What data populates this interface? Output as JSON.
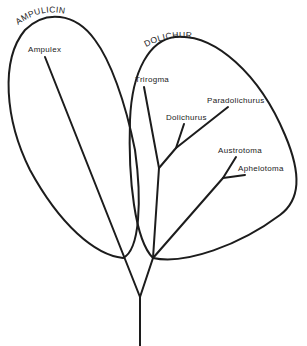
{
  "diagram": {
    "type": "phylogenetic-tree",
    "groups": [
      {
        "name": "AMPULICINI",
        "members": [
          "Ampulex"
        ]
      },
      {
        "name": "DOLICHURINI",
        "members": [
          "Trirogma",
          "Dolichurus",
          "Paradolichurus",
          "Austrotoma",
          "Aphelotoma"
        ]
      }
    ],
    "taxa": {
      "ampulex": "Ampulex",
      "trirogma": "Trirogma",
      "dolichurus": "Dolichurus",
      "paradolichurus": "Paradolichurus",
      "austrotoma": "Austrotoma",
      "aphelotoma": "Aphelotoma"
    },
    "colors": {
      "line": "#1c1c1c",
      "background": "#ffffff"
    }
  }
}
